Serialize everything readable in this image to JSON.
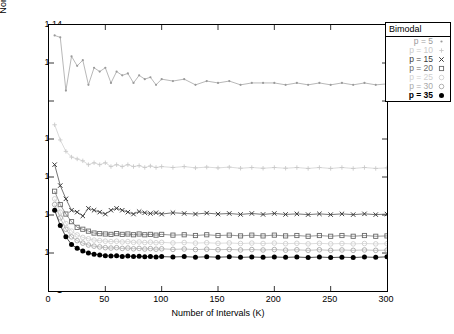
{
  "chart_data": {
    "type": "line",
    "title": "",
    "xlabel": "Number of Intervals (K)",
    "ylabel": "Normalized Bandwidth Requirement",
    "xlim": [
      0,
      300
    ],
    "ylim": [
      1,
      1.14
    ],
    "xticks": [
      0,
      50,
      100,
      150,
      200,
      250,
      300
    ],
    "xticklabels": [
      "0",
      "50",
      "100",
      "150",
      "200",
      "250",
      "300"
    ],
    "yticks": [
      1,
      1.02,
      1.04,
      1.06,
      1.08,
      1.1,
      1.12,
      1.14
    ],
    "yticklabels": [
      "1",
      "1.02",
      "1.04",
      "1.06",
      "1.08",
      "1.1",
      "1.12",
      "1.14"
    ],
    "grid": false,
    "legend_title": "Bimodal",
    "legend_position": "top-right",
    "series": [
      {
        "name": "p = 5",
        "label": "p = 5",
        "marker": "dot-small",
        "color": "#9a9a9a",
        "x": [
          5,
          10,
          15,
          20,
          25,
          30,
          35,
          40,
          45,
          50,
          55,
          60,
          65,
          70,
          75,
          80,
          85,
          90,
          95,
          100,
          110,
          120,
          130,
          140,
          150,
          160,
          170,
          180,
          190,
          200,
          210,
          220,
          230,
          240,
          250,
          260,
          270,
          280,
          290,
          300
        ],
        "y": [
          1.1345,
          1.1335,
          1.1055,
          1.1235,
          1.1185,
          1.1215,
          1.1085,
          1.1175,
          1.1155,
          1.1175,
          1.1095,
          1.1155,
          1.1135,
          1.1145,
          1.1095,
          1.1135,
          1.1115,
          1.1125,
          1.1085,
          1.1115,
          1.1105,
          1.1115,
          1.1085,
          1.1105,
          1.1095,
          1.1105,
          1.1085,
          1.1095,
          1.1095,
          1.1095,
          1.1085,
          1.1095,
          1.1085,
          1.1095,
          1.1085,
          1.1095,
          1.1085,
          1.1095,
          1.1085,
          1.109
        ]
      },
      {
        "name": "p = 10",
        "label": "p = 10",
        "marker": "plus",
        "color": "#cacaca",
        "x": [
          5,
          10,
          15,
          20,
          25,
          30,
          35,
          40,
          45,
          50,
          55,
          60,
          65,
          70,
          75,
          80,
          85,
          90,
          95,
          100,
          110,
          120,
          130,
          140,
          150,
          160,
          170,
          180,
          190,
          200,
          210,
          220,
          230,
          240,
          250,
          260,
          270,
          280,
          290,
          300
        ],
        "y": [
          1.0875,
          1.0795,
          1.0735,
          1.0705,
          1.0695,
          1.0685,
          1.0665,
          1.0675,
          1.0665,
          1.0675,
          1.0655,
          1.0665,
          1.0655,
          1.0665,
          1.0655,
          1.066,
          1.065,
          1.0658,
          1.065,
          1.0655,
          1.065,
          1.0655,
          1.0648,
          1.0652,
          1.0648,
          1.0652,
          1.0646,
          1.065,
          1.0646,
          1.065,
          1.0646,
          1.065,
          1.0645,
          1.065,
          1.0645,
          1.065,
          1.0645,
          1.065,
          1.0645,
          1.0648
        ]
      },
      {
        "name": "p = 15",
        "label": "p = 15",
        "marker": "x",
        "color": "#3a3a3a",
        "x": [
          5,
          10,
          15,
          20,
          25,
          30,
          35,
          40,
          45,
          50,
          55,
          60,
          65,
          70,
          75,
          80,
          85,
          90,
          95,
          100,
          110,
          120,
          130,
          140,
          150,
          160,
          170,
          180,
          190,
          200,
          210,
          220,
          230,
          240,
          250,
          260,
          270,
          280,
          290,
          300
        ],
        "y": [
          1.0665,
          1.0555,
          1.0485,
          1.0425,
          1.0415,
          1.0395,
          1.0435,
          1.0425,
          1.0415,
          1.0405,
          1.0425,
          1.0435,
          1.0425,
          1.0415,
          1.0405,
          1.0418,
          1.0412,
          1.0408,
          1.0412,
          1.0405,
          1.0412,
          1.0408,
          1.0405,
          1.041,
          1.0405,
          1.0408,
          1.0403,
          1.0408,
          1.0403,
          1.0408,
          1.0403,
          1.0406,
          1.0402,
          1.0406,
          1.0402,
          1.0406,
          1.0402,
          1.0406,
          1.0402,
          1.0405
        ]
      },
      {
        "name": "p = 20",
        "label": "p = 20",
        "marker": "square",
        "color": "#6a6a6a",
        "x": [
          5,
          10,
          15,
          20,
          25,
          30,
          35,
          40,
          45,
          50,
          55,
          60,
          65,
          70,
          75,
          80,
          85,
          90,
          95,
          100,
          110,
          120,
          130,
          140,
          150,
          160,
          170,
          180,
          190,
          200,
          210,
          220,
          230,
          240,
          250,
          260,
          270,
          280,
          290,
          300
        ],
        "y": [
          1.0525,
          1.0455,
          1.0405,
          1.0365,
          1.0335,
          1.0325,
          1.0315,
          1.0305,
          1.0302,
          1.03,
          1.0298,
          1.0302,
          1.0298,
          1.03,
          1.0296,
          1.03,
          1.0296,
          1.0298,
          1.0294,
          1.0298,
          1.0294,
          1.0296,
          1.0292,
          1.0296,
          1.0292,
          1.0294,
          1.029,
          1.0294,
          1.029,
          1.0294,
          1.029,
          1.0292,
          1.0288,
          1.0292,
          1.0288,
          1.0292,
          1.0288,
          1.0292,
          1.0288,
          1.029
        ]
      },
      {
        "name": "p = 25",
        "label": "p = 25",
        "marker": "circle-light",
        "color": "#cfcfcf",
        "x": [
          5,
          10,
          15,
          20,
          25,
          30,
          35,
          40,
          45,
          50,
          55,
          60,
          65,
          70,
          75,
          80,
          85,
          90,
          95,
          100,
          110,
          120,
          130,
          140,
          150,
          160,
          170,
          180,
          190,
          200,
          210,
          220,
          230,
          240,
          250,
          260,
          270,
          280,
          290,
          300
        ],
        "y": [
          1.0485,
          1.0415,
          1.0355,
          1.0315,
          1.0295,
          1.0282,
          1.0275,
          1.0268,
          1.0265,
          1.0262,
          1.026,
          1.0262,
          1.0258,
          1.026,
          1.0256,
          1.0258,
          1.0255,
          1.0257,
          1.0254,
          1.0256,
          1.0253,
          1.0255,
          1.0252,
          1.0254,
          1.0251,
          1.0253,
          1.025,
          1.0252,
          1.025,
          1.0252,
          1.0249,
          1.0251,
          1.0248,
          1.0251,
          1.0248,
          1.025,
          1.0248,
          1.025,
          1.0248,
          1.0249
        ]
      },
      {
        "name": "p = 30",
        "label": "p = 30",
        "marker": "circle",
        "color": "#a8a8a8",
        "x": [
          5,
          10,
          15,
          20,
          25,
          30,
          35,
          40,
          45,
          50,
          55,
          60,
          65,
          70,
          75,
          80,
          85,
          90,
          95,
          100,
          110,
          120,
          130,
          140,
          150,
          160,
          170,
          180,
          190,
          200,
          210,
          220,
          230,
          240,
          250,
          260,
          270,
          280,
          290,
          300
        ],
        "y": [
          1.0455,
          1.0385,
          1.0325,
          1.0285,
          1.0265,
          1.0252,
          1.0242,
          1.0236,
          1.0232,
          1.0228,
          1.0226,
          1.0228,
          1.0224,
          1.0226,
          1.0222,
          1.0224,
          1.0221,
          1.0223,
          1.022,
          1.0222,
          1.0219,
          1.0221,
          1.0218,
          1.022,
          1.0217,
          1.0219,
          1.0216,
          1.0218,
          1.0216,
          1.0218,
          1.0215,
          1.0217,
          1.0214,
          1.0217,
          1.0214,
          1.0216,
          1.0214,
          1.0216,
          1.0214,
          1.0215
        ]
      },
      {
        "name": "p = 35",
        "label": "p = 35",
        "marker": "filled-circle",
        "color": "#000000",
        "x": [
          5,
          10,
          15,
          20,
          25,
          30,
          35,
          40,
          45,
          50,
          55,
          60,
          65,
          70,
          75,
          80,
          85,
          90,
          95,
          100,
          110,
          120,
          130,
          140,
          150,
          160,
          170,
          180,
          190,
          200,
          210,
          220,
          230,
          240,
          250,
          260,
          270,
          280,
          290,
          300
        ],
        "y": [
          1.0425,
          1.0345,
          1.0285,
          1.0245,
          1.0225,
          1.021,
          1.02,
          1.0194,
          1.019,
          1.0186,
          1.0184,
          1.0186,
          1.0182,
          1.0184,
          1.0181,
          1.0183,
          1.018,
          1.0182,
          1.0179,
          1.0181,
          1.0179,
          1.0181,
          1.0178,
          1.018,
          1.0178,
          1.018,
          1.0177,
          1.0179,
          1.0177,
          1.0179,
          1.0177,
          1.0179,
          1.0176,
          1.0179,
          1.0176,
          1.0178,
          1.0176,
          1.0179,
          1.0177,
          1.018
        ]
      }
    ]
  }
}
